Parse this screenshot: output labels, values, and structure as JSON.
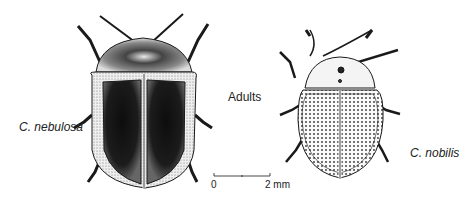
{
  "figure": {
    "title": "Adults",
    "specimens": [
      {
        "name": "C. nebulosa",
        "pattern": "dark-mottled"
      },
      {
        "name": "C. nobilis",
        "pattern": "punctate-light"
      }
    ],
    "scale_bar": {
      "start_label": "0",
      "end_label": "2 mm"
    },
    "colors": {
      "ink": "#1a1a1a",
      "background": "#ffffff",
      "dark_fill": "#111111",
      "light_fill": "#f2f2f2"
    }
  }
}
